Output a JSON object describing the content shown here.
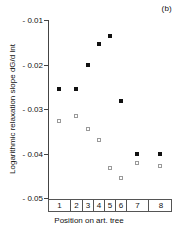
{
  "panel": {
    "label": "(b)"
  },
  "chart_data": {
    "type": "scatter",
    "title": "(b)",
    "xlabel": "Position on art. tree",
    "ylabel": "Logarithmic relaxation slope dG/d lnt",
    "categories": [
      "1",
      "2",
      "3",
      "4",
      "5",
      "6",
      "7",
      "8"
    ],
    "category_widths": [
      22,
      12,
      11,
      11,
      11,
      11,
      22,
      24
    ],
    "xlim": [
      0,
      8
    ],
    "ylim": [
      -0.05,
      -0.01
    ],
    "ytick_labels": [
      "- 0.01",
      "- 0.02",
      "- 0.03",
      "- 0.04",
      "- 0.05"
    ],
    "yticks": [
      -0.01,
      -0.02,
      -0.03,
      -0.04,
      -0.05
    ],
    "grid": false,
    "legend": null,
    "marker_colors": {
      "filled": "#111111",
      "open": "#9a9a9a"
    },
    "series": [
      {
        "name": "filled",
        "marker": "filled-square",
        "x": [
          1,
          2,
          3,
          4,
          5,
          6,
          7,
          8
        ],
        "values": [
          -0.0255,
          -0.0255,
          -0.02,
          -0.0155,
          -0.0135,
          -0.0282,
          -0.04,
          -0.04
        ]
      },
      {
        "name": "open",
        "marker": "open-square",
        "x": [
          1,
          2,
          3,
          4,
          5,
          6,
          7,
          8
        ],
        "values": [
          -0.0327,
          -0.0315,
          -0.0345,
          -0.037,
          -0.0433,
          -0.0455,
          -0.0422,
          -0.0428
        ]
      }
    ]
  }
}
